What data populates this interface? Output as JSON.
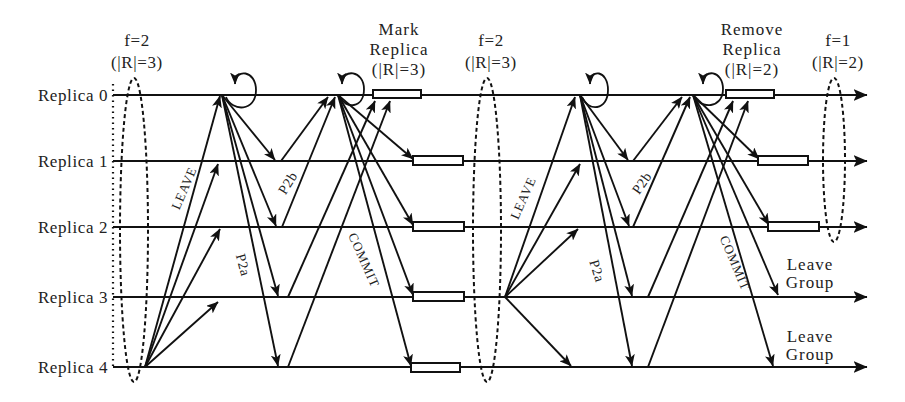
{
  "diagram": {
    "title": "",
    "replicas": [
      {
        "id": "r0",
        "label": "Replica 0"
      },
      {
        "id": "r1",
        "label": "Replica 1"
      },
      {
        "id": "r2",
        "label": "Replica 2"
      },
      {
        "id": "r3",
        "label": "Replica 3"
      },
      {
        "id": "r4",
        "label": "Replica 4"
      }
    ],
    "configurations": [
      {
        "f": "f=2",
        "size": "(|R|=3)",
        "covers": [
          "Replica 0",
          "Replica 1",
          "Replica 2",
          "Replica 3",
          "Replica 4"
        ]
      },
      {
        "f": "f=2",
        "size": "(|R|=3)",
        "covers": [
          "Replica 0",
          "Replica 1",
          "Replica 2",
          "Replica 3",
          "Replica 4"
        ]
      },
      {
        "f": "f=1",
        "size": "(|R|=2)",
        "covers": [
          "Replica 0",
          "Replica 1",
          "Replica 2"
        ]
      }
    ],
    "annotations": {
      "mark_replica": {
        "line1": "Mark",
        "line2": "Replica",
        "line3": "(|R|=3)"
      },
      "remove_replica": {
        "line1": "Remove",
        "line2": "Replica",
        "line3": "(|R|=2)"
      },
      "leave_group_r3": {
        "line1": "Leave",
        "line2": "Group"
      },
      "leave_group_r4": {
        "line1": "Leave",
        "line2": "Group"
      }
    },
    "phases": [
      {
        "leaving_replica": "Replica 4",
        "leader": "Replica 0",
        "labels": {
          "leave": "LEAVE",
          "p2a": "P2a",
          "p2b": "P2b",
          "commit": "COMMIT"
        },
        "messages": {
          "leave": [
            [
              "Replica 4",
              "Replica 0"
            ],
            [
              "Replica 4",
              "Replica 1"
            ],
            [
              "Replica 4",
              "Replica 2"
            ],
            [
              "Replica 4",
              "Replica 3"
            ]
          ],
          "p2a": [
            [
              "Replica 0",
              "Replica 1"
            ],
            [
              "Replica 0",
              "Replica 2"
            ],
            [
              "Replica 0",
              "Replica 3"
            ],
            [
              "Replica 0",
              "Replica 4"
            ]
          ],
          "p2b": [
            [
              "Replica 1",
              "Replica 0"
            ],
            [
              "Replica 2",
              "Replica 0"
            ],
            [
              "Replica 3",
              "Replica 0"
            ],
            [
              "Replica 4",
              "Replica 0"
            ]
          ],
          "commit": [
            [
              "Replica 0",
              "Replica 1"
            ],
            [
              "Replica 0",
              "Replica 2"
            ],
            [
              "Replica 0",
              "Replica 3"
            ],
            [
              "Replica 0",
              "Replica 4"
            ]
          ]
        },
        "execution_boxes": [
          "Replica 0",
          "Replica 1",
          "Replica 2",
          "Replica 3",
          "Replica 4"
        ]
      },
      {
        "leaving_replica": "Replica 3",
        "leader": "Replica 0",
        "labels": {
          "leave": "LEAVE",
          "p2a": "P2a",
          "p2b": "P2b",
          "commit": "COMMIT"
        },
        "messages": {
          "leave": [
            [
              "Replica 3",
              "Replica 0"
            ],
            [
              "Replica 3",
              "Replica 1"
            ],
            [
              "Replica 3",
              "Replica 2"
            ],
            [
              "Replica 3",
              "Replica 4"
            ]
          ],
          "p2a": [
            [
              "Replica 0",
              "Replica 1"
            ],
            [
              "Replica 0",
              "Replica 2"
            ],
            [
              "Replica 0",
              "Replica 3"
            ],
            [
              "Replica 0",
              "Replica 4"
            ]
          ],
          "p2b": [
            [
              "Replica 1",
              "Replica 0"
            ],
            [
              "Replica 2",
              "Replica 0"
            ],
            [
              "Replica 3",
              "Replica 0"
            ],
            [
              "Replica 4",
              "Replica 0"
            ]
          ],
          "commit": [
            [
              "Replica 0",
              "Replica 1"
            ],
            [
              "Replica 0",
              "Replica 2"
            ],
            [
              "Replica 0",
              "Replica 3"
            ],
            [
              "Replica 0",
              "Replica 4"
            ]
          ]
        },
        "execution_boxes": [
          "Replica 0",
          "Replica 1",
          "Replica 2"
        ]
      }
    ],
    "colors": {
      "stroke": "#111111",
      "text": "#222222",
      "background": "#ffffff"
    }
  }
}
